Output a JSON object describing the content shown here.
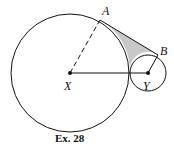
{
  "figure": {
    "caption": "Ex. 28",
    "points": {
      "A": "A",
      "B": "B",
      "X": "X",
      "Y": "Y"
    },
    "colors": {
      "stroke": "#111111",
      "shade": "#c8c8c8"
    },
    "big_circle": {
      "center": "X",
      "cx": 70,
      "cy": 73,
      "r": 59
    },
    "small_circle": {
      "center": "Y",
      "cx": 148,
      "cy": 73,
      "r": 18
    },
    "segments": [
      "XA (dashed)",
      "XY",
      "YB",
      "AB (tangent)"
    ]
  }
}
